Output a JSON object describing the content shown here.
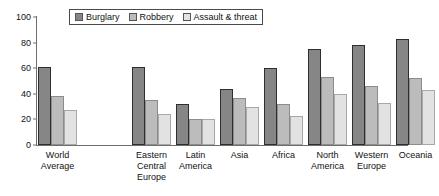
{
  "chart_data": {
    "type": "bar",
    "title": "",
    "xlabel": "",
    "ylabel": "",
    "ylim": [
      0,
      100
    ],
    "yticks": [
      0,
      20,
      40,
      60,
      80,
      100
    ],
    "grid": false,
    "legend_position": "top-center",
    "categories": [
      "World Average",
      "Eastern Central Europe",
      "Latin America",
      "Asia",
      "Africa",
      "North America",
      "Western Europe",
      "Oceania"
    ],
    "category_lines": [
      [
        "World",
        "Average"
      ],
      [
        "Eastern",
        "Central",
        "Europe"
      ],
      [
        "Latin",
        "America"
      ],
      [
        "Asia"
      ],
      [
        "Africa"
      ],
      [
        "North",
        "America"
      ],
      [
        "Western",
        "Europe"
      ],
      [
        "Oceania"
      ]
    ],
    "series": [
      {
        "name": "Burglary",
        "color": "#868686",
        "values": [
          61,
          61,
          32,
          44,
          60,
          75,
          78,
          83
        ]
      },
      {
        "name": "Robbery",
        "color": "#bcbcbc",
        "values": [
          38,
          35,
          20,
          37,
          32,
          53,
          46,
          52
        ]
      },
      {
        "name": "Assault & threat",
        "color": "#e2e2e2",
        "values": [
          27,
          24,
          20,
          30,
          23,
          40,
          33,
          43
        ]
      }
    ]
  }
}
